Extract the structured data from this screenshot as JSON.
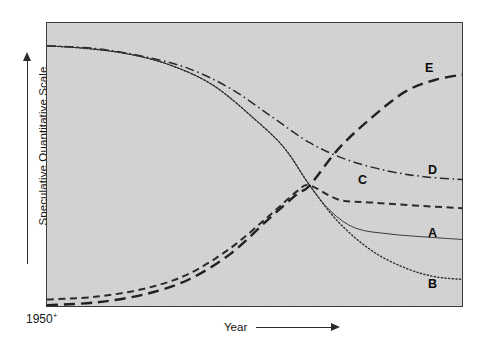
{
  "chart_data": {
    "type": "line",
    "title": "",
    "subtitle": "",
    "xlabel": "Year",
    "ylabel": "Speculative Quantitative Scale",
    "x_origin_label": "1950",
    "x_origin_superscript": "+",
    "grid": false,
    "legend_position": "inline-right-end-labels",
    "xlim": [
      0,
      100
    ],
    "ylim": [
      0,
      100
    ],
    "axis_ticks": [],
    "crossover_point": {
      "x": 63,
      "y": 43
    },
    "series": [
      {
        "name": "A",
        "label": "A",
        "style": "solid",
        "color": "#3a3a3a",
        "width": 1.0,
        "trend": "declining",
        "points": [
          {
            "x": 0,
            "y": 92
          },
          {
            "x": 10,
            "y": 91
          },
          {
            "x": 20,
            "y": 89
          },
          {
            "x": 30,
            "y": 85
          },
          {
            "x": 40,
            "y": 78
          },
          {
            "x": 50,
            "y": 66
          },
          {
            "x": 57,
            "y": 56
          },
          {
            "x": 63,
            "y": 43
          },
          {
            "x": 68,
            "y": 34
          },
          {
            "x": 74,
            "y": 28
          },
          {
            "x": 82,
            "y": 26
          },
          {
            "x": 90,
            "y": 25
          },
          {
            "x": 100,
            "y": 24
          }
        ]
      },
      {
        "name": "B",
        "label": "B",
        "style": "dotted",
        "color": "#2e2e2e",
        "width": 1.4,
        "trend": "declining-steepest",
        "points": [
          {
            "x": 0,
            "y": 92
          },
          {
            "x": 10,
            "y": 91
          },
          {
            "x": 20,
            "y": 89
          },
          {
            "x": 30,
            "y": 85
          },
          {
            "x": 40,
            "y": 78
          },
          {
            "x": 50,
            "y": 66
          },
          {
            "x": 57,
            "y": 56
          },
          {
            "x": 63,
            "y": 43
          },
          {
            "x": 70,
            "y": 30
          },
          {
            "x": 78,
            "y": 20
          },
          {
            "x": 86,
            "y": 14
          },
          {
            "x": 93,
            "y": 11
          },
          {
            "x": 100,
            "y": 10
          }
        ]
      },
      {
        "name": "C",
        "label": "C",
        "style": "dashed",
        "color": "#2b2b2b",
        "width": 2.0,
        "trend": "rising-plateau",
        "points": [
          {
            "x": 0,
            "y": 3
          },
          {
            "x": 12,
            "y": 4
          },
          {
            "x": 24,
            "y": 7
          },
          {
            "x": 34,
            "y": 12
          },
          {
            "x": 44,
            "y": 21
          },
          {
            "x": 53,
            "y": 32
          },
          {
            "x": 60,
            "y": 41
          },
          {
            "x": 63,
            "y": 43
          },
          {
            "x": 70,
            "y": 38
          },
          {
            "x": 78,
            "y": 37
          },
          {
            "x": 88,
            "y": 36
          },
          {
            "x": 100,
            "y": 35
          }
        ]
      },
      {
        "name": "D",
        "label": "D",
        "style": "dash-dot",
        "color": "#2b2b2b",
        "width": 1.5,
        "trend": "declining-gentle",
        "points": [
          {
            "x": 0,
            "y": 92
          },
          {
            "x": 12,
            "y": 91
          },
          {
            "x": 24,
            "y": 88
          },
          {
            "x": 34,
            "y": 84
          },
          {
            "x": 44,
            "y": 77
          },
          {
            "x": 54,
            "y": 67
          },
          {
            "x": 63,
            "y": 58
          },
          {
            "x": 72,
            "y": 52
          },
          {
            "x": 82,
            "y": 48
          },
          {
            "x": 91,
            "y": 46
          },
          {
            "x": 100,
            "y": 45
          }
        ]
      },
      {
        "name": "E",
        "label": "E",
        "style": "long-dash",
        "color": "#212121",
        "width": 2.4,
        "trend": "rising-highest",
        "points": [
          {
            "x": 0,
            "y": 1
          },
          {
            "x": 12,
            "y": 2
          },
          {
            "x": 24,
            "y": 5
          },
          {
            "x": 34,
            "y": 10
          },
          {
            "x": 44,
            "y": 19
          },
          {
            "x": 53,
            "y": 31
          },
          {
            "x": 60,
            "y": 40
          },
          {
            "x": 63,
            "y": 43
          },
          {
            "x": 70,
            "y": 56
          },
          {
            "x": 78,
            "y": 67
          },
          {
            "x": 86,
            "y": 76
          },
          {
            "x": 93,
            "y": 80
          },
          {
            "x": 100,
            "y": 82
          }
        ]
      }
    ],
    "series_labels": [
      {
        "name": "E",
        "text": "E"
      },
      {
        "name": "D",
        "text": "D"
      },
      {
        "name": "C",
        "text": "C"
      },
      {
        "name": "A",
        "text": "A"
      },
      {
        "name": "B",
        "text": "B"
      }
    ]
  },
  "colors": {
    "panel_background": "#d3d3d3",
    "page_background": "#ffffff",
    "axis": "#2b2b2b",
    "text": "#141414"
  }
}
